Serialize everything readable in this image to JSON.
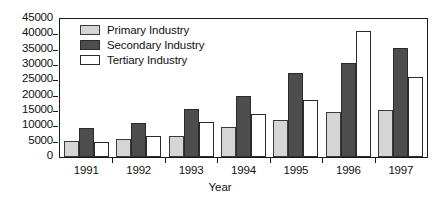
{
  "chart_data": {
    "type": "bar",
    "title": "",
    "subtitle": "",
    "xlabel": "Year",
    "ylabel": "",
    "categories": [
      "1991",
      "1992",
      "1993",
      "1994",
      "1995",
      "1996",
      "1997"
    ],
    "series": [
      {
        "name": "Primary Industry",
        "color": "#d5d5d5",
        "values": [
          5300,
          5800,
          7000,
          9800,
          12000,
          14800,
          15200
        ]
      },
      {
        "name": "Secondary Industry",
        "color": "#4d4d4d",
        "values": [
          9500,
          11000,
          15500,
          20000,
          27500,
          30500,
          35500
        ]
      },
      {
        "name": "Tertiary Industry",
        "color": "#ffffff",
        "values": [
          5000,
          7000,
          11500,
          14000,
          18500,
          41000,
          26000
        ]
      }
    ],
    "ylim": [
      0,
      45000
    ],
    "yticks": [
      0,
      5000,
      10000,
      15000,
      20000,
      25000,
      30000,
      35000,
      40000,
      45000
    ],
    "ytick_labels": [
      "0",
      "5000",
      "10000",
      "15000",
      "20000",
      "25000",
      "30000",
      "35000",
      "40000",
      "45000"
    ],
    "grid": false,
    "legend_position": "upper-left-inside",
    "frame": true
  },
  "legend": {
    "items": [
      {
        "label": "Primary Industry",
        "swatch": "primary"
      },
      {
        "label": "Secondary Industry",
        "swatch": "secondary"
      },
      {
        "label": "Tertiary Industry",
        "swatch": "tertiary"
      }
    ]
  }
}
